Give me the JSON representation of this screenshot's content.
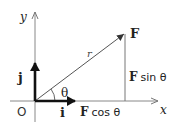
{
  "diagram": {
    "type": "vector-decomposition",
    "axes": {
      "x_label": "x",
      "y_label": "y",
      "origin_label": "O"
    },
    "unit_vectors": {
      "i": "i",
      "j": "j"
    },
    "vector": {
      "label": "F",
      "magnitude_label": "r",
      "angle_label": "θ"
    },
    "components": {
      "horizontal_prefix": "F",
      "horizontal_suffix": "cos θ",
      "vertical_prefix": "F",
      "vertical_suffix": "sin θ"
    },
    "colors": {
      "axis": "#888888",
      "vector": "#555555",
      "unit": "#1a1a1a",
      "text": "#222222"
    }
  }
}
